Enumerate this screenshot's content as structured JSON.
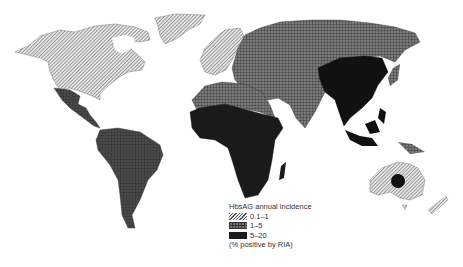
{
  "legend": {
    "title": "HbsAG annual incidence",
    "items": [
      {
        "label": "0.1–1",
        "pattern": "diagonal-hatch",
        "color": "#dddddd"
      },
      {
        "label": "1–5",
        "pattern": "grid",
        "color": "#777777"
      },
      {
        "label": "5–20",
        "pattern": "solid",
        "color": "#1a1a1a"
      }
    ],
    "note": "(% positive by RIA)"
  },
  "regions": {
    "north_america": "0.1–1",
    "greenland": "0.1–1",
    "western_europe": "0.1–1",
    "australia": "0.1–1",
    "new_zealand": "0.1–1",
    "central_america": "1–5",
    "south_america": "1–5",
    "eastern_europe_russia": "1–5",
    "north_africa_middle_east": "1–5",
    "india_south_asia": "1–5",
    "japan": "1–5",
    "sub_saharan_africa": "5–20",
    "china_southeast_asia": "5–20",
    "indonesia_philippines": "5–20",
    "central_australia_spot": "5–20"
  }
}
